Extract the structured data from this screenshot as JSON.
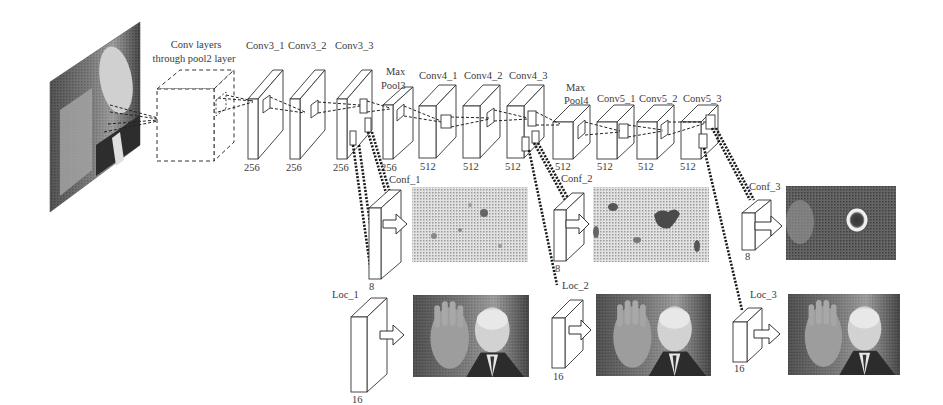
{
  "diagram": {
    "input_image": {
      "label": "input-photo",
      "description": "Man waving hand (grayscale photo)"
    },
    "pre_block": {
      "label_line1": "Conv layers",
      "label_line2": "through pool2 layer"
    },
    "layers": [
      {
        "name": "Conv3_1",
        "channels": "256"
      },
      {
        "name": "Conv3_2",
        "channels": "256"
      },
      {
        "name": "Conv3_3",
        "channels": "256"
      },
      {
        "name": "Max Pool3",
        "name_line1": "Max",
        "name_line2": "Pool3",
        "channels": "256"
      },
      {
        "name": "Conv4_1",
        "channels": "512"
      },
      {
        "name": "Conv4_2",
        "channels": "512"
      },
      {
        "name": "Conv4_3",
        "channels": "512"
      },
      {
        "name": "Max Pool4",
        "name_line1": "Max",
        "name_line2": "Pool4",
        "channels": "512"
      },
      {
        "name": "Conv5_1",
        "channels": "512"
      },
      {
        "name": "Conv5_2",
        "channels": "512"
      },
      {
        "name": "Conv5_3",
        "channels": "512"
      }
    ],
    "heads": [
      {
        "source": "Conv3_3",
        "conf_label": "Conf_1",
        "conf_channels": "8",
        "loc_label": "Loc_1",
        "loc_channels": "16",
        "conf_map": "noisy-sparse-heatmap",
        "loc_output": "photo-with-boxes"
      },
      {
        "source": "Conv4_3",
        "conf_label": "Conf_2",
        "conf_channels": "8",
        "loc_label": "Loc_2",
        "loc_channels": "16",
        "conf_map": "blob-heatmap",
        "loc_output": "photo-with-boxes"
      },
      {
        "source": "Conv5_3",
        "conf_label": "Conf_3",
        "conf_channels": "8",
        "loc_label": "Loc_3",
        "loc_channels": "16",
        "conf_map": "ring-heatmap",
        "loc_output": "photo-with-boxes"
      }
    ],
    "colors": {
      "line": "#222222",
      "background": "#ffffff",
      "photo_dark": "#3a3a3a",
      "photo_light": "#cfcfcf",
      "heatmap_light": "#dedede"
    }
  }
}
